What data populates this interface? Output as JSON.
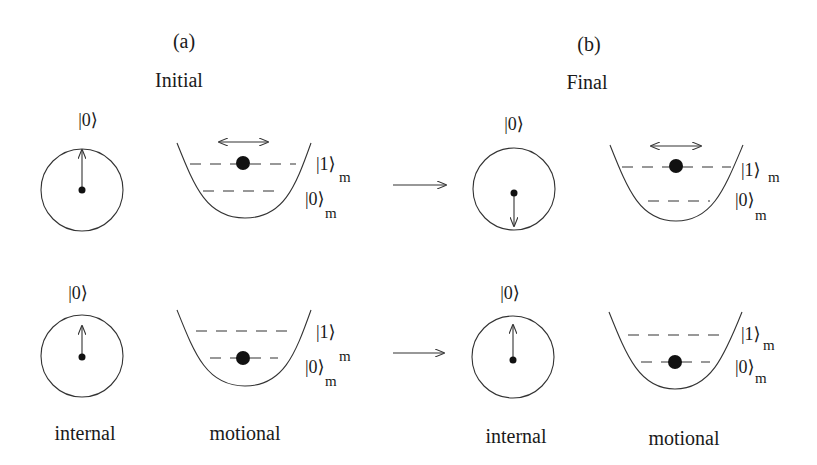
{
  "panels": [
    {
      "id": "a",
      "tag": "(a)",
      "title": "Initial"
    },
    {
      "id": "b",
      "tag": "(b)",
      "title": "Final"
    }
  ],
  "kets": {
    "internal": "|0⟩",
    "motional_1": "|1⟩",
    "motional_0": "|0⟩",
    "subscript": "m"
  },
  "column_labels": {
    "internal": "internal",
    "motional": "motional"
  },
  "rows": [
    {
      "row": "top",
      "initial": {
        "spin": "up",
        "motional_level": 1,
        "oscillating": true
      },
      "final": {
        "spin": "down",
        "motional_level": 1,
        "oscillating": true
      }
    },
    {
      "row": "bottom",
      "initial": {
        "spin": "up",
        "motional_level": 0,
        "oscillating": false
      },
      "final": {
        "spin": "up",
        "motional_level": 0,
        "oscillating": false
      }
    }
  ],
  "colors": {
    "stroke": "#333333",
    "text": "#1a1a1a",
    "background": "#ffffff"
  }
}
